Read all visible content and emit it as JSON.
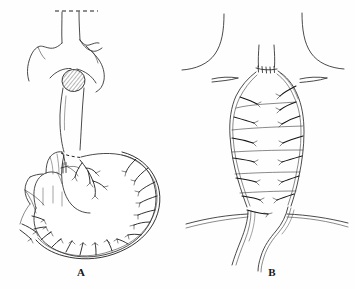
{
  "figure": {
    "kind": "medical-line-illustration",
    "title_visible": false,
    "background_color": "#fefefe",
    "ink_color": "#2b2b2b",
    "panels": [
      {
        "id": "A",
        "label": "A",
        "label_x": 81,
        "label_y": 276,
        "subject": "stomach-with-vascular-arcade-and-esophagus-through-diaphragmatic-hiatus",
        "elements": [
          "resected-esophagus-stump",
          "dashed-transection-line-superior",
          "aortic-arch-outline",
          "hatched-diaphragmatic-hiatus",
          "esophagus-body",
          "dashed-cardia-resection-line",
          "stomach-body",
          "duodenum-and-pylorus",
          "ligature-clip-on-left-gastric-artery",
          "gastroepiploic-arcade",
          "omental-vessel-branches"
        ]
      },
      {
        "id": "B",
        "label": "B",
        "label_x": 272,
        "label_y": 276,
        "subject": "gastric-conduit-pulled-up-to-neck-with-cervical-anastomosis",
        "elements": [
          "neck-outline-left",
          "neck-outline-right",
          "clavicle-left",
          "clavicle-right",
          "cervical-esophagus",
          "anastomosis-suture-line",
          "gastric-conduit-tube",
          "conduit-vascular-branches",
          "diaphragm-line",
          "conduit-pedicle-below-diaphragm"
        ]
      }
    ]
  },
  "labels": {
    "panel_a": "A",
    "panel_b": "B"
  },
  "colors": {
    "ink": "#2b2b2b",
    "vessel_ink": "#1d1d1d",
    "background": "#fefefe",
    "hatch": "#3a3a3a"
  }
}
